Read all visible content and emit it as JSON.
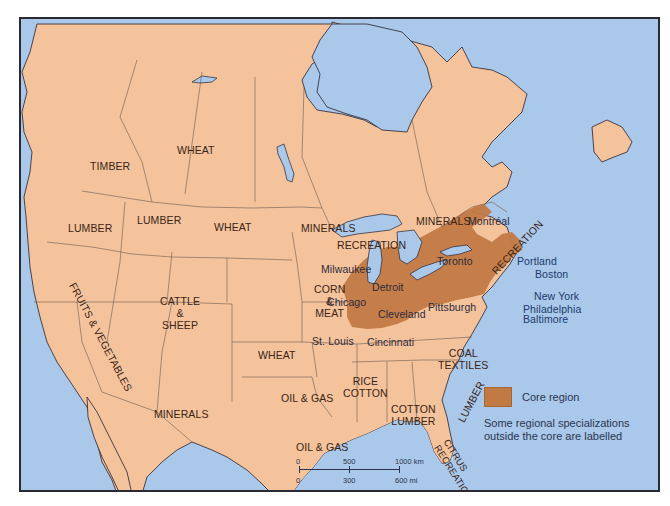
{
  "map": {
    "title": "North America core region and regional specializations",
    "colors": {
      "water": "#a9c8ea",
      "land": "#f4c39c",
      "core": "#c27a45",
      "border": "#2a2a33",
      "label": "#3a2416",
      "city_label": "#213a6b"
    },
    "specializations": [
      {
        "id": "timber",
        "label": "TIMBER"
      },
      {
        "id": "wheat-canada",
        "label": "WHEAT"
      },
      {
        "id": "lumber-west",
        "label": "LUMBER"
      },
      {
        "id": "lumber-idaho",
        "label": "LUMBER"
      },
      {
        "id": "wheat-dakota",
        "label": "WHEAT"
      },
      {
        "id": "minerals-mn",
        "label": "MINERALS"
      },
      {
        "id": "minerals-ontario",
        "label": "MINERALS"
      },
      {
        "id": "recreation-wi",
        "label": "RECREATION"
      },
      {
        "id": "recreation-ne",
        "label": "RECREATION"
      },
      {
        "id": "fruits-vegetables",
        "label": "FRUITS & VEGETABLES"
      },
      {
        "id": "cattle-sheep",
        "lines": [
          "CATTLE",
          "&",
          "SHEEP"
        ]
      },
      {
        "id": "corn-meat",
        "lines": [
          "CORN",
          "&",
          "MEAT"
        ]
      },
      {
        "id": "wheat-kansas",
        "label": "WHEAT"
      },
      {
        "id": "minerals-sw",
        "label": "MINERALS"
      },
      {
        "id": "oil-gas-ok",
        "label": "OIL & GAS"
      },
      {
        "id": "oil-gas-tx",
        "label": "OIL & GAS"
      },
      {
        "id": "rice-cotton",
        "lines": [
          "RICE",
          "COTTON"
        ]
      },
      {
        "id": "cotton-lumber",
        "lines": [
          "COTTON",
          "LUMBER"
        ]
      },
      {
        "id": "coal-textiles",
        "lines": [
          "COAL",
          "TEXTILES"
        ]
      },
      {
        "id": "lumber-se",
        "label": "LUMBER"
      },
      {
        "id": "citrus-recreation",
        "lines": [
          "CITRUS",
          "RECREATION"
        ]
      }
    ],
    "cities": [
      {
        "id": "montreal",
        "label": "Montréal"
      },
      {
        "id": "toronto",
        "label": "Toronto"
      },
      {
        "id": "milwaukee",
        "label": "Milwaukee"
      },
      {
        "id": "detroit",
        "label": "Detroit"
      },
      {
        "id": "chicago",
        "label": "Chicago"
      },
      {
        "id": "cleveland",
        "label": "Cleveland"
      },
      {
        "id": "pittsburgh",
        "label": "Pittsburgh"
      },
      {
        "id": "st-louis",
        "label": "St. Louis"
      },
      {
        "id": "cincinnati",
        "label": "Cincinnati"
      },
      {
        "id": "portland",
        "label": "Portland"
      },
      {
        "id": "boston",
        "label": "Boston"
      },
      {
        "id": "new-york",
        "label": "New York"
      },
      {
        "id": "philadelphia",
        "label": "Philadelphia"
      },
      {
        "id": "baltimore",
        "label": "Baltimore"
      }
    ],
    "legend": {
      "swatch_label": "Core region",
      "note": "Some regional specializations outside the core are labelled"
    },
    "scale": {
      "km_ticks": [
        "0",
        "500",
        "1000 km"
      ],
      "mi_ticks": [
        "0",
        "300",
        "600 mi"
      ]
    }
  }
}
